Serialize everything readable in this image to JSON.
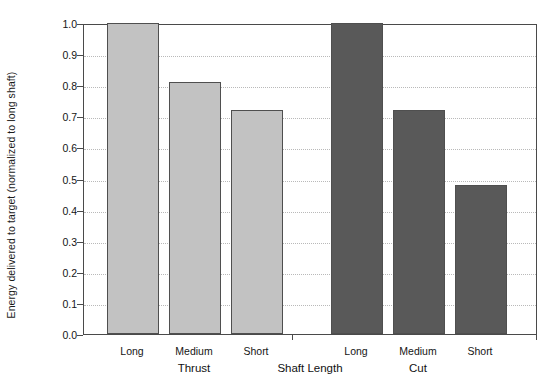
{
  "chart_data": {
    "type": "bar",
    "title": "",
    "xlabel": "Shaft Length",
    "ylabel": "Energy delivered to target (normalized to long shaft)",
    "ylim": [
      0.0,
      1.0
    ],
    "grid": true,
    "legend": "none",
    "categories": [
      "Long",
      "Medium",
      "Short"
    ],
    "groups": [
      {
        "name": "Thrust",
        "color": "#c2c2c2",
        "values": [
          1.0,
          0.81,
          0.72
        ]
      },
      {
        "name": "Cut",
        "color": "#595959",
        "values": [
          1.0,
          0.72,
          0.48
        ]
      }
    ],
    "ytick_labels": [
      "1.0",
      "0.9",
      "0.8",
      "0.7",
      "0.6",
      "0.5",
      "0.4",
      "0.3",
      "0.2",
      "0.1",
      "0.0"
    ],
    "ytick_values": [
      1.0,
      0.9,
      0.8,
      0.7,
      0.6,
      0.5,
      0.4,
      0.3,
      0.2,
      0.1,
      0.0
    ],
    "bar_edge_color": "#4f4f4f",
    "axis_color": "#4a4a4a",
    "gridline_color": "#b9b9b9",
    "background": "#ffffff"
  }
}
